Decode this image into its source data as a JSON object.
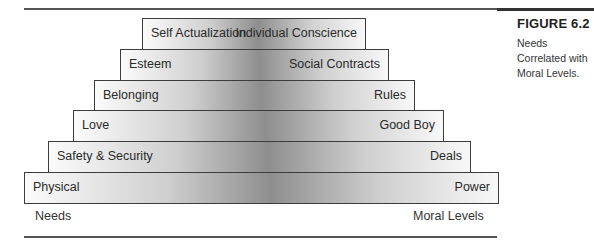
{
  "figure": {
    "title": "FIGURE 6.2",
    "caption": "Needs Correlated with Moral Levels."
  },
  "axis_labels": {
    "left": "Needs",
    "right": "Moral Levels"
  },
  "steps": [
    {
      "need": "Self Actualization",
      "moral_level": "Individual Conscience"
    },
    {
      "need": "Esteem",
      "moral_level": "Social Contracts"
    },
    {
      "need": "Belonging",
      "moral_level": "Rules"
    },
    {
      "need": "Love",
      "moral_level": "Good Boy"
    },
    {
      "need": "Safety & Security",
      "moral_level": "Deals"
    },
    {
      "need": "Physical",
      "moral_level": "Power"
    }
  ],
  "colors": {
    "border": "#3c3c3c",
    "gradient_center": "#8e8e8e",
    "gradient_edge": "#fbfbfb",
    "rule": "#555555"
  }
}
